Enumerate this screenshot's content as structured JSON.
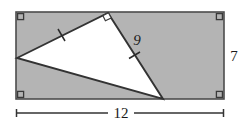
{
  "figure": {
    "colors": {
      "rect_fill": "#b4b4b4",
      "rect_stroke": "#4d4d4d",
      "triangle_fill": "#ffffff",
      "triangle_stroke": "#333333",
      "label_color": "#1a1a1a",
      "dimension_line": "#333333",
      "page_background": "#ffffff"
    },
    "rectangle": {
      "name": "shaded-rectangle",
      "x": 16,
      "y": 12,
      "width": 208,
      "height": 87,
      "corner_marks": [
        {
          "name": "right-angle-mark-top-left",
          "x": 16,
          "y": 12,
          "size": 7
        },
        {
          "name": "right-angle-mark-top-right",
          "x": 224,
          "y": 12,
          "size": 7
        },
        {
          "name": "right-angle-mark-bottom-left",
          "x": 16,
          "y": 99,
          "size": 7
        },
        {
          "name": "right-angle-mark-bottom-right",
          "x": 224,
          "y": 99,
          "size": 7
        }
      ]
    },
    "triangle": {
      "name": "inscribed-right-triangle",
      "points": "17,58 108,13 163,99",
      "vertices": [
        {
          "name": "vertex-left",
          "x": 17,
          "y": 58
        },
        {
          "name": "vertex-apex",
          "x": 108,
          "y": 13
        },
        {
          "name": "vertex-bottom",
          "x": 163,
          "y": 99
        }
      ],
      "right_angle_at": "vertex-apex",
      "right_angle_marker": {
        "name": "right-angle-mark-apex",
        "points": "102.8,15.6 105.4,20.8 111.2,18.0 108.5,12.8"
      }
    },
    "tick_marks": [
      {
        "name": "congruence-tick-upper-left-leg",
        "x1": 58.0,
        "y1": 29.0,
        "x2": 65.0,
        "y2": 41.0
      },
      {
        "name": "congruence-tick-right-leg",
        "x1": 129.0,
        "y1": 58.5,
        "x2": 140.0,
        "y2": 52.0
      }
    ],
    "labels": {
      "side_nine": {
        "text": "9",
        "x": 137,
        "y": 45,
        "style": "italic"
      },
      "height_seven": {
        "text": "7",
        "x": 234,
        "y": 61,
        "style": "upright"
      },
      "width_twelve": {
        "text": "12",
        "x": 121,
        "y": 118,
        "style": "upright"
      }
    },
    "dimension_lines": {
      "bottom": {
        "name": "dimension-line-width",
        "x1": 16,
        "x2": 224,
        "y": 113,
        "tick_half_height": 4,
        "gap_start": 108,
        "gap_end": 134
      }
    }
  }
}
